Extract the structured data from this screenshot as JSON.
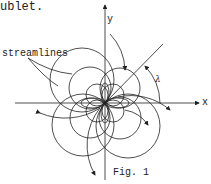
{
  "diagram": {
    "caption_fragment": "ublet.",
    "label_streamlines": "streamlines",
    "figure_label": "Fig. 1",
    "axes": {
      "x_label": "x",
      "y_label": "y",
      "angle_label": "λ"
    },
    "colors": {
      "ink": "#222222",
      "background": "#ffffff"
    }
  }
}
